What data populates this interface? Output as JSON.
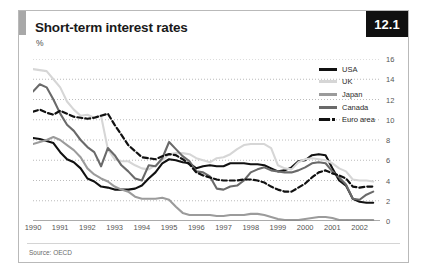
{
  "figure": {
    "title": "Short-term interest rates",
    "subtitle": "%",
    "badge": "12.1",
    "source": "Source: OECD"
  },
  "colors": {
    "usa": "#111111",
    "uk": "#d6d6d6",
    "japan": "#9b9b9b",
    "canada": "#6a6a6a",
    "euro_area": "#111111",
    "grid": "#aaaaaa",
    "axis": "#555555",
    "badge_bg": "#101010",
    "accent": "#a8a8a8"
  },
  "chart_data": {
    "type": "line",
    "title": "Short-term interest rates",
    "subtitle": "%",
    "xlabel": "",
    "ylabel": "%",
    "ylim": [
      0,
      16
    ],
    "yticks": [
      0,
      2,
      4,
      6,
      8,
      10,
      12,
      14,
      16
    ],
    "xlim": [
      1990,
      2002.75
    ],
    "xticks": [
      1990,
      1991,
      1992,
      1993,
      1994,
      1995,
      1996,
      1997,
      1998,
      1999,
      2000,
      2001,
      2002
    ],
    "grid": "horizontal-dotted",
    "legend_position": "top-right",
    "x": [
      1990.0,
      1990.25,
      1990.5,
      1990.75,
      1991.0,
      1991.25,
      1991.5,
      1991.75,
      1992.0,
      1992.25,
      1992.5,
      1992.75,
      1993.0,
      1993.25,
      1993.5,
      1993.75,
      1994.0,
      1994.25,
      1994.5,
      1994.75,
      1995.0,
      1995.25,
      1995.5,
      1995.75,
      1996.0,
      1996.25,
      1996.5,
      1996.75,
      1997.0,
      1997.25,
      1997.5,
      1997.75,
      1998.0,
      1998.25,
      1998.5,
      1998.75,
      1999.0,
      1999.25,
      1999.5,
      1999.75,
      2000.0,
      2000.25,
      2000.5,
      2000.75,
      2001.0,
      2001.25,
      2001.5,
      2001.75,
      2002.0,
      2002.25,
      2002.5
    ],
    "series": [
      {
        "name": "USA",
        "color": "#111111",
        "style": "solid",
        "width": 2.1,
        "values": [
          8.2,
          8.1,
          7.9,
          7.7,
          6.8,
          6.1,
          5.8,
          5.2,
          4.2,
          3.9,
          3.4,
          3.3,
          3.1,
          3.1,
          3.1,
          3.2,
          3.5,
          4.2,
          4.8,
          5.7,
          6.1,
          6.0,
          5.8,
          5.7,
          5.2,
          5.4,
          5.5,
          5.4,
          5.4,
          5.7,
          5.7,
          5.7,
          5.6,
          5.6,
          5.5,
          5.2,
          4.9,
          5.0,
          5.3,
          5.9,
          6.0,
          6.5,
          6.6,
          6.5,
          5.2,
          4.0,
          3.5,
          2.2,
          1.9,
          1.8,
          1.8
        ]
      },
      {
        "name": "UK",
        "color": "#d6d6d6",
        "style": "solid",
        "width": 2.1,
        "values": [
          15.0,
          14.9,
          14.8,
          14.0,
          13.2,
          11.8,
          11.0,
          10.4,
          10.5,
          10.2,
          10.4,
          7.1,
          6.1,
          5.9,
          5.9,
          5.5,
          5.2,
          5.1,
          5.5,
          6.0,
          6.6,
          6.7,
          6.7,
          6.6,
          6.2,
          6.0,
          5.8,
          6.2,
          6.3,
          6.6,
          7.1,
          7.5,
          7.6,
          7.6,
          7.6,
          7.2,
          5.5,
          5.2,
          5.1,
          5.8,
          6.1,
          6.2,
          6.1,
          6.0,
          5.7,
          5.2,
          4.9,
          4.1,
          4.0,
          4.0,
          3.9
        ]
      },
      {
        "name": "Japan",
        "color": "#9b9b9b",
        "style": "solid",
        "width": 2.1,
        "values": [
          7.6,
          7.8,
          8.0,
          8.3,
          8.0,
          7.5,
          7.0,
          6.3,
          5.2,
          4.6,
          4.2,
          3.9,
          3.4,
          3.1,
          2.9,
          2.4,
          2.2,
          2.2,
          2.2,
          2.3,
          2.1,
          1.4,
          0.8,
          0.6,
          0.6,
          0.6,
          0.6,
          0.5,
          0.5,
          0.6,
          0.6,
          0.6,
          0.7,
          0.7,
          0.6,
          0.4,
          0.2,
          0.1,
          0.1,
          0.1,
          0.2,
          0.3,
          0.4,
          0.4,
          0.3,
          0.1,
          0.1,
          0.1,
          0.1,
          0.1,
          0.1
        ]
      },
      {
        "name": "Canada",
        "color": "#6a6a6a",
        "style": "solid",
        "width": 2.1,
        "values": [
          12.8,
          13.5,
          13.2,
          12.0,
          10.6,
          9.5,
          8.9,
          8.0,
          7.3,
          6.8,
          5.4,
          7.2,
          6.5,
          5.5,
          4.9,
          4.2,
          4.0,
          5.5,
          5.4,
          6.2,
          7.8,
          7.1,
          6.4,
          5.9,
          4.9,
          4.8,
          4.4,
          3.2,
          3.1,
          3.4,
          3.5,
          4.0,
          4.8,
          5.1,
          5.3,
          5.0,
          4.9,
          4.8,
          4.8,
          5.0,
          5.3,
          5.7,
          5.8,
          5.7,
          4.9,
          4.3,
          3.6,
          2.2,
          2.1,
          2.6,
          2.9
        ]
      },
      {
        "name": "Euro area",
        "color": "#111111",
        "style": "dashed",
        "width": 2.2,
        "values": [
          10.8,
          11.0,
          10.7,
          10.5,
          10.9,
          10.6,
          10.3,
          10.2,
          10.1,
          10.2,
          10.4,
          10.6,
          9.5,
          8.5,
          7.5,
          6.9,
          6.3,
          6.2,
          6.1,
          6.4,
          6.6,
          6.5,
          6.1,
          5.6,
          4.8,
          4.5,
          4.3,
          4.1,
          4.0,
          4.0,
          4.0,
          4.1,
          4.1,
          4.0,
          3.8,
          3.4,
          3.1,
          2.9,
          2.9,
          3.3,
          3.7,
          4.3,
          4.8,
          5.0,
          4.7,
          4.5,
          4.2,
          3.4,
          3.3,
          3.4,
          3.4
        ]
      }
    ]
  },
  "legend": {
    "items": [
      {
        "label": "USA"
      },
      {
        "label": "UK"
      },
      {
        "label": "Japan"
      },
      {
        "label": "Canada"
      },
      {
        "label": "Euro area"
      }
    ]
  }
}
